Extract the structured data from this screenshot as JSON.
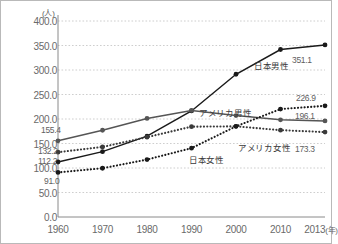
{
  "chart_data": {
    "type": "line",
    "title": "",
    "xlabel": "年",
    "ylabel": "(人)",
    "unit_label": "(人)",
    "x": [
      1960,
      1970,
      1980,
      1990,
      2000,
      2010,
      2013
    ],
    "categories": [
      "1960",
      "1970",
      "1980",
      "1990",
      "2000",
      "2010",
      "2013"
    ],
    "xtick_labels": [
      "1960",
      "1970",
      "1980",
      "1990",
      "2000",
      "2010",
      "2013"
    ],
    "xtick_suffix": "(年)",
    "ylim": [
      0,
      400
    ],
    "ytick_labels": [
      "400.0",
      "350.0",
      "300.0",
      "250.0",
      "200.0",
      "150.0",
      "100.0",
      "50.0",
      "0.0"
    ],
    "ytick_values": [
      400,
      350,
      300,
      250,
      200,
      150,
      100,
      50,
      0
    ],
    "grid": true,
    "grid_style": "dotted-horizontal",
    "legend": "inline-annotations",
    "series": [
      {
        "name": "日本男性",
        "label": "日本男性",
        "style": "solid",
        "color": "#1a1a1a",
        "values": [
          112.2,
          133.4,
          165.0,
          216.4,
          291.3,
          341.8,
          351.1
        ],
        "start_label": "112.2",
        "end_label": "351.1"
      },
      {
        "name": "アメリカ男性",
        "label": "アメリカ男性",
        "style": "solid",
        "color": "#555555",
        "values": [
          155.4,
          177.0,
          201.2,
          217.5,
          207.0,
          198.3,
          196.1
        ],
        "start_label": "155.4",
        "end_label": "196.1"
      },
      {
        "name": "アメリカ女性",
        "label": "アメリカ女性",
        "style": "dotted",
        "color": "#3a3a3a",
        "values": [
          132.2,
          143.0,
          163.0,
          184.3,
          185.0,
          177.2,
          173.3
        ],
        "start_label": "132.2",
        "end_label": "173.3"
      },
      {
        "name": "日本女性",
        "label": "日本女性",
        "style": "dotted",
        "color": "#1a1a1a",
        "values": [
          91.0,
          99.5,
          117.2,
          140.5,
          185.0,
          220.2,
          226.9
        ],
        "start_label": "91.0",
        "end_label": "226.9"
      }
    ],
    "annotations": [
      {
        "text": "155.4",
        "series": "アメリカ男性",
        "position": "start"
      },
      {
        "text": "132.2",
        "series": "アメリカ女性",
        "position": "start"
      },
      {
        "text": "112.2",
        "series": "日本男性",
        "position": "start"
      },
      {
        "text": "91.0",
        "series": "日本女性",
        "position": "start"
      },
      {
        "text": "351.1",
        "series": "日本男性",
        "position": "end"
      },
      {
        "text": "226.9",
        "series": "日本女性",
        "position": "end"
      },
      {
        "text": "196.1",
        "series": "アメリカ男性",
        "position": "end"
      },
      {
        "text": "173.3",
        "series": "アメリカ女性",
        "position": "end"
      },
      {
        "text": "日本男性",
        "type": "series-name"
      },
      {
        "text": "アメリカ男性",
        "type": "series-name"
      },
      {
        "text": "日本女性",
        "type": "series-name"
      },
      {
        "text": "アメリカ女性",
        "type": "series-name"
      }
    ]
  }
}
